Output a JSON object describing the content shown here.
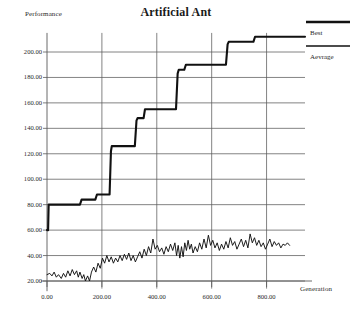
{
  "chart_data": {
    "type": "line",
    "title": "Artificial Ant",
    "xlabel": "Generation",
    "ylabel": "Performance",
    "grid": true,
    "legend_position": "top-right",
    "xlim": [
      0,
      940
    ],
    "ylim": [
      10,
      215
    ],
    "xticks": [
      0,
      200,
      400,
      600,
      800
    ],
    "xticklabels": [
      "0.00",
      "200.00",
      "400.00",
      "600.00",
      "800.00"
    ],
    "yticks": [
      20,
      40,
      60,
      80,
      100,
      120,
      140,
      160,
      180,
      200
    ],
    "yticklabels": [
      "20.00",
      "40.00",
      "60.00",
      "80.00",
      "100.00",
      "120.00",
      "140.00",
      "160.00",
      "180.00",
      "200.00"
    ],
    "series": [
      {
        "name": "Best",
        "style": "step",
        "points": [
          [
            0,
            60
          ],
          [
            4,
            60
          ],
          [
            6,
            80
          ],
          [
            120,
            80
          ],
          [
            126,
            84
          ],
          [
            176,
            84
          ],
          [
            182,
            88
          ],
          [
            228,
            88
          ],
          [
            233,
            122
          ],
          [
            236,
            126
          ],
          [
            320,
            126
          ],
          [
            326,
            146
          ],
          [
            330,
            148
          ],
          [
            352,
            148
          ],
          [
            357,
            155
          ],
          [
            470,
            155
          ],
          [
            476,
            183
          ],
          [
            480,
            186
          ],
          [
            500,
            186
          ],
          [
            506,
            190
          ],
          [
            652,
            190
          ],
          [
            658,
            206
          ],
          [
            662,
            208
          ],
          [
            752,
            208
          ],
          [
            758,
            212
          ],
          [
            940,
            212
          ]
        ]
      },
      {
        "name": "Aevrage",
        "style": "noisy-line",
        "points": [
          [
            0,
            25
          ],
          [
            10,
            26
          ],
          [
            18,
            24
          ],
          [
            26,
            27
          ],
          [
            34,
            23
          ],
          [
            42,
            25
          ],
          [
            52,
            22
          ],
          [
            60,
            26
          ],
          [
            68,
            23
          ],
          [
            76,
            28
          ],
          [
            84,
            24
          ],
          [
            92,
            29
          ],
          [
            100,
            25
          ],
          [
            108,
            28
          ],
          [
            114,
            23
          ],
          [
            120,
            27
          ],
          [
            128,
            22
          ],
          [
            134,
            25
          ],
          [
            140,
            20
          ],
          [
            148,
            24
          ],
          [
            155,
            20
          ],
          [
            162,
            27
          ],
          [
            170,
            31
          ],
          [
            178,
            27
          ],
          [
            186,
            34
          ],
          [
            194,
            30
          ],
          [
            202,
            38
          ],
          [
            210,
            34
          ],
          [
            218,
            40
          ],
          [
            226,
            35
          ],
          [
            234,
            39
          ],
          [
            242,
            34
          ],
          [
            250,
            38
          ],
          [
            258,
            35
          ],
          [
            266,
            40
          ],
          [
            274,
            36
          ],
          [
            282,
            41
          ],
          [
            290,
            37
          ],
          [
            298,
            42
          ],
          [
            306,
            36
          ],
          [
            314,
            40
          ],
          [
            322,
            35
          ],
          [
            330,
            39
          ],
          [
            338,
            43
          ],
          [
            346,
            38
          ],
          [
            354,
            45
          ],
          [
            362,
            40
          ],
          [
            370,
            47
          ],
          [
            378,
            42
          ],
          [
            386,
            53
          ],
          [
            394,
            45
          ],
          [
            402,
            48
          ],
          [
            410,
            43
          ],
          [
            418,
            46
          ],
          [
            426,
            41
          ],
          [
            434,
            47
          ],
          [
            442,
            43
          ],
          [
            450,
            49
          ],
          [
            458,
            44
          ],
          [
            466,
            50
          ],
          [
            472,
            40
          ],
          [
            478,
            48
          ],
          [
            484,
            38
          ],
          [
            490,
            47
          ],
          [
            496,
            39
          ],
          [
            502,
            50
          ],
          [
            508,
            44
          ],
          [
            514,
            52
          ],
          [
            520,
            45
          ],
          [
            526,
            49
          ],
          [
            532,
            42
          ],
          [
            540,
            47
          ],
          [
            548,
            43
          ],
          [
            556,
            50
          ],
          [
            564,
            45
          ],
          [
            572,
            53
          ],
          [
            580,
            46
          ],
          [
            588,
            56
          ],
          [
            596,
            48
          ],
          [
            604,
            52
          ],
          [
            612,
            46
          ],
          [
            620,
            50
          ],
          [
            628,
            44
          ],
          [
            636,
            49
          ],
          [
            644,
            45
          ],
          [
            652,
            51
          ],
          [
            660,
            46
          ],
          [
            668,
            54
          ],
          [
            676,
            48
          ],
          [
            684,
            51
          ],
          [
            692,
            45
          ],
          [
            700,
            49
          ],
          [
            708,
            53
          ],
          [
            716,
            47
          ],
          [
            724,
            52
          ],
          [
            732,
            46
          ],
          [
            740,
            57
          ],
          [
            748,
            50
          ],
          [
            756,
            54
          ],
          [
            764,
            48
          ],
          [
            772,
            52
          ],
          [
            780,
            47
          ],
          [
            788,
            50
          ],
          [
            796,
            45
          ],
          [
            804,
            49
          ],
          [
            812,
            53
          ],
          [
            820,
            47
          ],
          [
            828,
            51
          ],
          [
            836,
            48
          ],
          [
            844,
            50
          ],
          [
            852,
            46
          ],
          [
            860,
            49
          ],
          [
            868,
            48
          ],
          [
            876,
            50
          ],
          [
            884,
            48
          ]
        ]
      }
    ]
  },
  "title": "Artificial Ant",
  "axis": {
    "y_axis_label": "Performance",
    "x_axis_label": "Generation"
  },
  "legend": {
    "items": [
      {
        "label": "Best",
        "color": "#111111",
        "width": 2.2
      },
      {
        "label": "Aevrage",
        "color": "#111111",
        "width": 1.4
      }
    ]
  },
  "colors": {
    "line": "#111111",
    "grid": "#5a5a5a",
    "text": "#2a2a2a",
    "background": "#ffffff"
  }
}
